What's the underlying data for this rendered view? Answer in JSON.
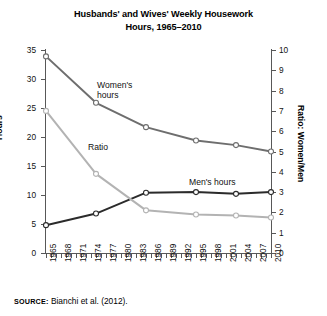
{
  "chart_data": {
    "type": "line",
    "title": "Husbands' and Wives' Weekly Housework Hours, 1965–2010",
    "title_line1": "Husbands' and Wives' Weekly Housework",
    "title_line2": "Hours, 1965–2010",
    "xlabel": "",
    "ylabel": "Hours",
    "ylabel_secondary": "Ratio: Women/Men",
    "ylim": [
      0,
      35
    ],
    "ylim_secondary": [
      0,
      10
    ],
    "yticks": [
      0,
      5,
      10,
      15,
      20,
      25,
      30,
      35
    ],
    "yticks_secondary": [
      0,
      1,
      2,
      3,
      4,
      5,
      6,
      7,
      8,
      9,
      10
    ],
    "xlim": [
      1965,
      2010
    ],
    "xticks": [
      1965,
      1968,
      1971,
      1974,
      1977,
      1980,
      1983,
      1986,
      1989,
      1992,
      1995,
      1998,
      2001,
      2004,
      2007,
      2010
    ],
    "xtick_labels": [
      "1965",
      "1968",
      "1971",
      "1974",
      "1977",
      "1980",
      "1983",
      "1986",
      "1989",
      "1992",
      "1995",
      "1998",
      "2001",
      "2004",
      "2007",
      "2010"
    ],
    "x": [
      1965,
      1975,
      1985,
      1995,
      2003,
      2010
    ],
    "grid": false,
    "legend": "inline-annotations",
    "series": [
      {
        "name": "Women's hours",
        "axis": "left",
        "color": "#6e6e6e",
        "label": "Women's",
        "label_line2": "hours",
        "values": [
          33.9,
          25.9,
          21.7,
          19.4,
          18.6,
          17.5
        ]
      },
      {
        "name": "Men's hours",
        "axis": "left",
        "color": "#2b2b2b",
        "label": "Men's hours",
        "values": [
          4.8,
          6.8,
          10.4,
          10.5,
          10.2,
          10.5
        ]
      },
      {
        "name": "Ratio",
        "axis": "right",
        "color": "#b3b3b3",
        "label": "Ratio",
        "values": [
          7.0,
          3.9,
          2.1,
          1.9,
          1.85,
          1.75
        ],
        "values_left_scale": [
          24.9,
          13.7,
          7.4,
          6.6,
          6.5,
          6.1
        ]
      }
    ],
    "source_label": "SOURCE:",
    "source_text": "Bianchi et al. (2012)."
  },
  "colors": {
    "women_line": "#6e6e6e",
    "men_line": "#2b2b2b",
    "ratio_line": "#b3b3b3",
    "axis": "#585858",
    "text": "#000000",
    "background": "#ffffff"
  }
}
